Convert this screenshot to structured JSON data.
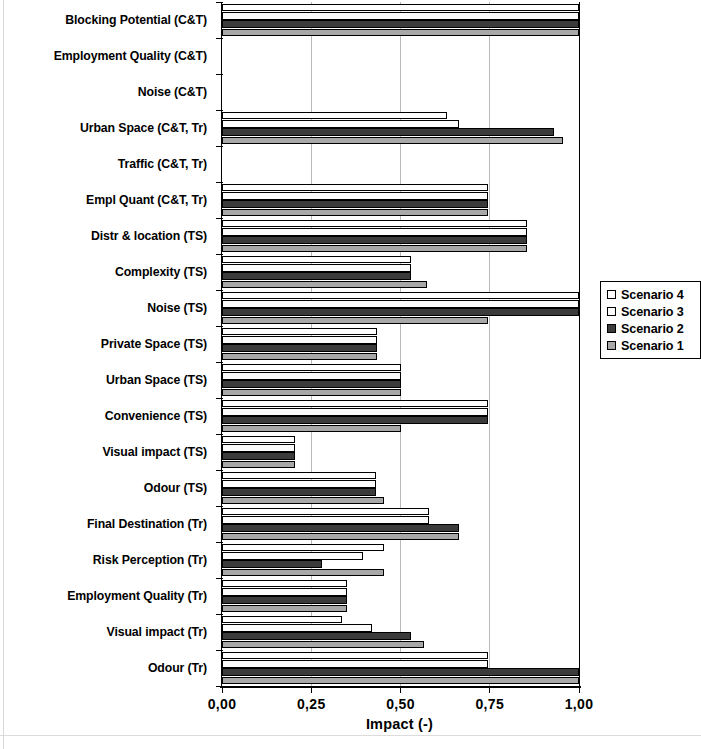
{
  "chart_data": {
    "type": "bar",
    "orientation": "horizontal",
    "title": "",
    "xlabel": "Impact (-)",
    "ylabel": "",
    "xlim": [
      0.0,
      1.0
    ],
    "xticks": [
      0.0,
      0.25,
      0.5,
      0.75,
      1.0
    ],
    "xtick_labels": [
      "0,00",
      "0,25",
      "0,50",
      "0,75",
      "1,00"
    ],
    "grid": "vertical",
    "legend_position": "right",
    "categories": [
      "Blocking Potential (C&T)",
      "Employment  Quality (C&T)",
      "Noise (C&T)",
      "Urban Space (C&T, Tr)",
      "Traffic (C&T, Tr)",
      "Empl Quant (C&T, Tr)",
      "Distr & location (TS)",
      "Complexity (TS)",
      "Noise (TS)",
      "Private Space (TS)",
      "Urban Space (TS)",
      "Convenience (TS)",
      "Visual impact (TS)",
      "Odour (TS)",
      "Final Destination (Tr)",
      "Risk Perception (Tr)",
      "Employment Quality (Tr)",
      "Visual impact (Tr)",
      "Odour (Tr)"
    ],
    "series": [
      {
        "name": "Scenario 4",
        "color": "#ffffff",
        "values": [
          1.0,
          0.0,
          0.0,
          0.63,
          0.0,
          0.745,
          0.855,
          0.53,
          1.0,
          0.435,
          0.5,
          0.745,
          0.205,
          0.43,
          0.58,
          0.455,
          0.35,
          0.335,
          0.745
        ]
      },
      {
        "name": "Scenario 3",
        "color": "#fbfbfb",
        "values": [
          1.0,
          0.0,
          0.0,
          0.665,
          0.0,
          0.745,
          0.855,
          0.53,
          1.0,
          0.435,
          0.5,
          0.745,
          0.205,
          0.43,
          0.58,
          0.395,
          0.35,
          0.42,
          0.745
        ]
      },
      {
        "name": "Scenario 2",
        "color": "#3b3b3b",
        "values": [
          1.0,
          0.0,
          0.0,
          0.93,
          0.0,
          0.745,
          0.855,
          0.53,
          1.0,
          0.435,
          0.5,
          0.745,
          0.205,
          0.43,
          0.665,
          0.28,
          0.35,
          0.53,
          1.0
        ]
      },
      {
        "name": "Scenario 1",
        "color": "#a8a8a8",
        "values": [
          1.0,
          0.0,
          0.0,
          0.955,
          0.0,
          0.745,
          0.855,
          0.575,
          0.745,
          0.435,
          0.5,
          0.5,
          0.205,
          0.455,
          0.665,
          0.455,
          0.35,
          0.565,
          1.0
        ]
      }
    ]
  },
  "legend": {
    "items": [
      {
        "label": "Scenario 4",
        "swatch": "#ffffff"
      },
      {
        "label": "Scenario 3",
        "swatch": "#fbfbfb"
      },
      {
        "label": "Scenario 2",
        "swatch": "#3b3b3b"
      },
      {
        "label": "Scenario 1",
        "swatch": "#a8a8a8"
      }
    ]
  }
}
